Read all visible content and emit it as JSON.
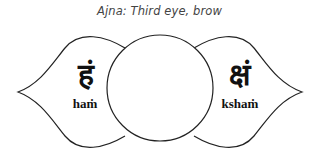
{
  "title": "Ajna: Third eye, brow",
  "petals": [
    {
      "side": "left",
      "glyph": "हं",
      "label": "haṁ"
    },
    {
      "side": "right",
      "glyph": "क्षं",
      "label": "kshaṁ"
    }
  ],
  "colors": {
    "stroke": "#222222",
    "text": "#111111",
    "title": "#444444"
  }
}
